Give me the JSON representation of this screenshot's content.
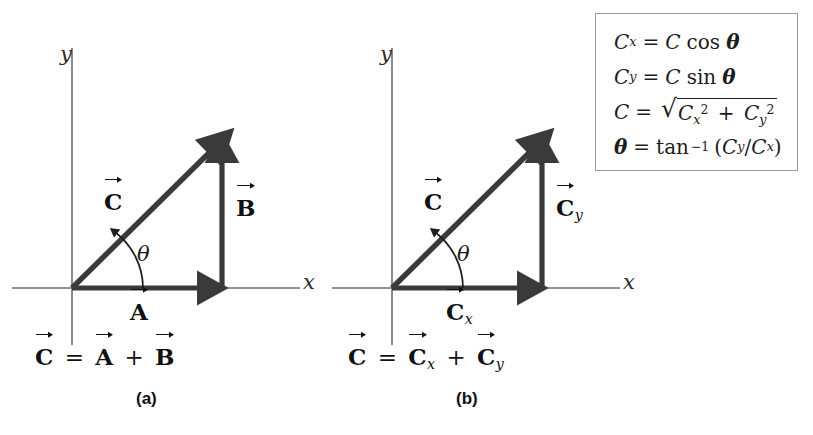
{
  "figure": {
    "background_color": "#ffffff",
    "ink_color": "#111111",
    "axis_color": "#6e6e6e",
    "box_border_color": "#9a9a9a"
  },
  "panels": [
    {
      "id": "a",
      "caption": "(a)",
      "axis_x_label": "x",
      "axis_y_label": "y",
      "angle_label": "θ",
      "vectors": [
        {
          "name": "resultant",
          "label_base": "C",
          "label_sub": "",
          "role": "hypotenuse"
        },
        {
          "name": "horizontal",
          "label_base": "A",
          "label_sub": "",
          "role": "x-component"
        },
        {
          "name": "vertical",
          "label_base": "B",
          "label_sub": "",
          "role": "y-component"
        }
      ],
      "equation": {
        "lhs_base": "C",
        "lhs_sub": "",
        "operator": "=",
        "term1_base": "A",
        "term1_sub": "",
        "plus": "+",
        "term2_base": "B",
        "term2_sub": ""
      }
    },
    {
      "id": "b",
      "caption": "(b)",
      "axis_x_label": "x",
      "axis_y_label": "y",
      "angle_label": "θ",
      "vectors": [
        {
          "name": "resultant",
          "label_base": "C",
          "label_sub": "",
          "role": "hypotenuse"
        },
        {
          "name": "horizontal",
          "label_base": "C",
          "label_sub": "x",
          "role": "x-component"
        },
        {
          "name": "vertical",
          "label_base": "C",
          "label_sub": "y",
          "role": "y-component"
        }
      ],
      "equation": {
        "lhs_base": "C",
        "lhs_sub": "",
        "operator": "=",
        "term1_base": "C",
        "term1_sub": "x",
        "plus": "+",
        "term2_base": "C",
        "term2_sub": "y"
      }
    }
  ],
  "formula_box": {
    "lines": [
      {
        "id": "cx",
        "lhs_var": "C",
        "lhs_sub": "x",
        "eq": "=",
        "rhs_var": "C",
        "rhs_func": "cos",
        "rhs_arg": "θ"
      },
      {
        "id": "cy",
        "lhs_var": "C",
        "lhs_sub": "y",
        "eq": "=",
        "rhs_var": "C",
        "rhs_func": "sin",
        "rhs_arg": "θ"
      },
      {
        "id": "magnitude",
        "lhs_var": "C",
        "lhs_sub": "",
        "eq": "=",
        "radical_sign": "√",
        "term1_var": "C",
        "term1_sub": "x",
        "term1_exp": "2",
        "plus": "+",
        "term2_var": "C",
        "term2_sub": "y",
        "term2_exp": "2"
      },
      {
        "id": "angle",
        "lhs_var": "θ",
        "eq": "=",
        "func": "tan",
        "func_exp": "−1",
        "open": "(",
        "num_var": "C",
        "num_sub": "y",
        "slash": "/",
        "den_var": "C",
        "den_sub": "x",
        "close": ")"
      }
    ]
  }
}
